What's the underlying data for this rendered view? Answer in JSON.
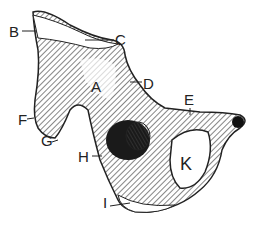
{
  "figure": {
    "labels": [
      {
        "id": "A",
        "text": "A",
        "x": 91,
        "y": 79
      },
      {
        "id": "B",
        "text": "B",
        "x": 9,
        "y": 24
      },
      {
        "id": "C",
        "text": "C",
        "x": 115,
        "y": 32
      },
      {
        "id": "D",
        "text": "D",
        "x": 143,
        "y": 76
      },
      {
        "id": "E",
        "text": "E",
        "x": 184,
        "y": 92
      },
      {
        "id": "F",
        "text": "F",
        "x": 18,
        "y": 112
      },
      {
        "id": "G",
        "text": "G",
        "x": 41,
        "y": 133
      },
      {
        "id": "H",
        "text": "H",
        "x": 78,
        "y": 149
      },
      {
        "id": "I",
        "text": "I",
        "x": 103,
        "y": 195
      },
      {
        "id": "K",
        "text": "K",
        "x": 180,
        "y": 155
      }
    ],
    "colors": {
      "ink": "#222222",
      "shade": "#555555",
      "background": "#ffffff"
    }
  }
}
